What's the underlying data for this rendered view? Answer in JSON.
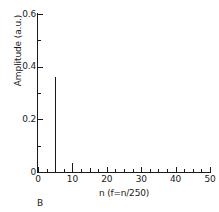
{
  "panel": {
    "label": "B"
  },
  "chart_data": {
    "type": "bar",
    "title": "",
    "subtitle": "",
    "xlabel": "n (f=n/250)",
    "ylabel": "Amplitude (a.u.)",
    "xlim": [
      0,
      50
    ],
    "ylim": [
      0,
      0.6
    ],
    "grid": false,
    "legend": null,
    "legend_position": "none",
    "x_major_ticks": [
      0,
      10,
      20,
      30,
      40,
      50
    ],
    "x_major_tick_labels": [
      "0",
      "10",
      "20",
      "30",
      "40",
      "50"
    ],
    "x_minor_tick_interval": 2.5,
    "y_major_ticks": [
      0,
      0.2,
      0.4,
      0.6
    ],
    "y_major_tick_labels": [
      "0",
      "0.2",
      "0.4",
      "0.6"
    ],
    "y_minor_tick_interval": 0.1,
    "tick_direction": "in",
    "spines_visible": [
      "left",
      "bottom"
    ],
    "line_color": "#1a1a1a",
    "background_color": "#ffffff",
    "x": [
      5,
      10,
      15,
      20
    ],
    "values": [
      0.36,
      0.035,
      0.015,
      0.008
    ],
    "series": [
      {
        "name": "Amplitude spectrum",
        "x": [
          5,
          10,
          15,
          20
        ],
        "values": [
          0.36,
          0.035,
          0.015,
          0.008
        ]
      }
    ],
    "annotations": []
  }
}
